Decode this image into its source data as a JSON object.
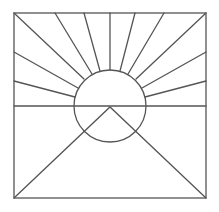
{
  "diagram": {
    "title": "",
    "stroke_color": "#555555",
    "background": "#ffffff",
    "frame": {
      "x": 14,
      "y": 13,
      "width": 192,
      "height": 185
    },
    "horizon_y": 106,
    "sun": {
      "cx": 110,
      "cy": 106,
      "r": 36
    },
    "rays": [
      {
        "x1": 14,
        "y1": 13,
        "x2": 84,
        "y2": 79
      },
      {
        "x1": 55,
        "y1": 13,
        "x2": 92,
        "y2": 74
      },
      {
        "x1": 84,
        "y1": 13,
        "x2": 100,
        "y2": 71
      },
      {
        "x1": 110,
        "y1": 13,
        "x2": 110,
        "y2": 70
      },
      {
        "x1": 135,
        "y1": 13,
        "x2": 120,
        "y2": 71
      },
      {
        "x1": 164,
        "y1": 13,
        "x2": 128,
        "y2": 74
      },
      {
        "x1": 206,
        "y1": 13,
        "x2": 136,
        "y2": 79
      },
      {
        "x1": 14,
        "y1": 52,
        "x2": 78,
        "y2": 88
      },
      {
        "x1": 14,
        "y1": 81,
        "x2": 75,
        "y2": 97
      },
      {
        "x1": 206,
        "y1": 52,
        "x2": 142,
        "y2": 88
      },
      {
        "x1": 206,
        "y1": 81,
        "x2": 145,
        "y2": 97
      }
    ],
    "triangle": {
      "apex": [
        110,
        107
      ],
      "left": [
        14,
        198
      ],
      "right": [
        206,
        198
      ]
    }
  }
}
